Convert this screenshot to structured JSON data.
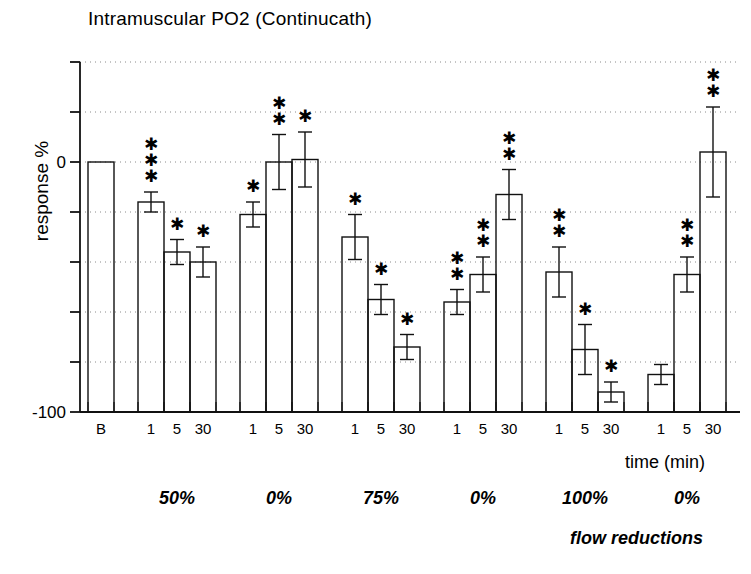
{
  "chart_data": {
    "type": "bar",
    "title": "Intramuscular PO2 (Continucath)",
    "xlabel": "time (min)",
    "ylabel": "response %",
    "secondary_xlabel": "flow reductions",
    "ylim": [
      -100,
      40
    ],
    "ytick_values": [
      40,
      20,
      0,
      -20,
      -40,
      -60,
      -80,
      -100
    ],
    "ytick_labels": [
      "",
      "",
      "0",
      "",
      "",
      "",
      "",
      "-100"
    ],
    "grid": true,
    "legend": "none",
    "error_bars": "SEM",
    "baseline": {
      "label": "B",
      "value": 0,
      "error": 0,
      "stars": 0
    },
    "categories": [
      "1",
      "5",
      "30"
    ],
    "groups": [
      {
        "flow_reduction": "50%",
        "bars": [
          {
            "time": "1",
            "value": -16,
            "error": 4,
            "stars": 3
          },
          {
            "time": "5",
            "value": -36,
            "error": 5,
            "stars": 1
          },
          {
            "time": "30",
            "value": -40,
            "error": 6,
            "stars": 1
          }
        ]
      },
      {
        "flow_reduction": "0%",
        "bars": [
          {
            "time": "1",
            "value": -21,
            "error": 5,
            "stars": 1
          },
          {
            "time": "5",
            "value": 0,
            "error": 11,
            "stars": 2
          },
          {
            "time": "30",
            "value": 1,
            "error": 11,
            "stars": 1
          }
        ]
      },
      {
        "flow_reduction": "75%",
        "bars": [
          {
            "time": "1",
            "value": -30,
            "error": 9,
            "stars": 1
          },
          {
            "time": "5",
            "value": -55,
            "error": 6,
            "stars": 1
          },
          {
            "time": "30",
            "value": -74,
            "error": 5,
            "stars": 1
          }
        ]
      },
      {
        "flow_reduction": "0%",
        "bars": [
          {
            "time": "1",
            "value": -56,
            "error": 5,
            "stars": 2
          },
          {
            "time": "5",
            "value": -45,
            "error": 7,
            "stars": 2
          },
          {
            "time": "30",
            "value": -13,
            "error": 10,
            "stars": 2
          }
        ]
      },
      {
        "flow_reduction": "100%",
        "bars": [
          {
            "time": "1",
            "value": -44,
            "error": 10,
            "stars": 2
          },
          {
            "time": "5",
            "value": -75,
            "error": 10,
            "stars": 1
          },
          {
            "time": "30",
            "value": -92,
            "error": 4,
            "stars": 1
          }
        ]
      },
      {
        "flow_reduction": "0%",
        "bars": [
          {
            "time": "1",
            "value": -85,
            "error": 4,
            "stars": 0
          },
          {
            "time": "5",
            "value": -45,
            "error": 7,
            "stars": 2
          },
          {
            "time": "30",
            "value": 4,
            "error": 18,
            "stars": 2
          }
        ]
      }
    ]
  }
}
